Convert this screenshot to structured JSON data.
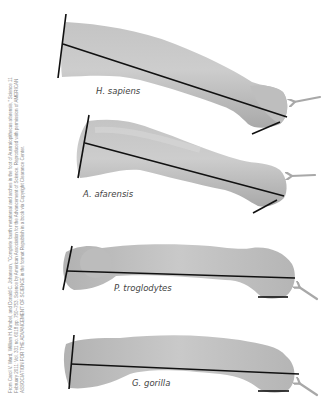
{
  "figure": {
    "credit_line_1": "From Carol V. Ward, William H. Kimbel, and Donald C. Johanson, \"Complete fourth metatarsal and arches in the foot of Australopithecus afarensis,\" Science 11",
    "credit_line_2": "February 2011: Vol. 331 no. 6018 pp. 750–753. Science by American Association for the Advancement of Science. Reproduced with permission of AMERICAN",
    "credit_line_3": "ASSOCIATION FOR THE ADVANCEMENT OF SCIENCE in the format Republish in a book via Copyright Clearance Center.",
    "specimens": [
      {
        "name": "H. sapiens"
      },
      {
        "name": "A. afarensis"
      },
      {
        "name": "P. troglodytes"
      },
      {
        "name": "G. gorilla"
      }
    ],
    "colors": {
      "bone_fill": "#b9b9b9",
      "bone_highlight": "#d2d2d2",
      "bone_shadow": "#9a9a9a",
      "axis_line": "#111111",
      "arrow": "#a8a8a8",
      "credit_text": "#8a8a8a",
      "label_text": "#444444"
    }
  }
}
